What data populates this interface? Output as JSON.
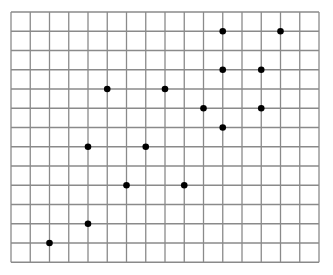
{
  "grid": {
    "left": 11,
    "top": 12,
    "cols": 16,
    "rows": 13,
    "cell": 19.25,
    "line_color": "#8a8a8a",
    "background": "#ffffff"
  },
  "points_color": "#000000",
  "points": [
    {
      "col": 11,
      "row": 1
    },
    {
      "col": 14,
      "row": 1
    },
    {
      "col": 11,
      "row": 3
    },
    {
      "col": 13,
      "row": 3
    },
    {
      "col": 5,
      "row": 4
    },
    {
      "col": 8,
      "row": 4
    },
    {
      "col": 10,
      "row": 5
    },
    {
      "col": 13,
      "row": 5
    },
    {
      "col": 11,
      "row": 6
    },
    {
      "col": 4,
      "row": 7
    },
    {
      "col": 7,
      "row": 7
    },
    {
      "col": 6,
      "row": 9
    },
    {
      "col": 9,
      "row": 9
    },
    {
      "col": 4,
      "row": 11
    },
    {
      "col": 2,
      "row": 12
    }
  ]
}
